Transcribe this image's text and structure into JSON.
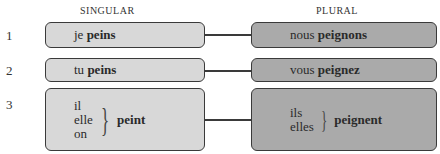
{
  "headers": {
    "singular": "SINGULAR",
    "plural": "PLURAL"
  },
  "rows": [
    {
      "number": "1",
      "singular": {
        "pronoun": "je",
        "verb": "peins"
      },
      "plural": {
        "pronoun": "nous",
        "verb": "peignons"
      }
    },
    {
      "number": "2",
      "singular": {
        "pronoun": "tu",
        "verb": "peins"
      },
      "plural": {
        "pronoun": "vous",
        "verb": "peignez"
      }
    },
    {
      "number": "3",
      "singular": {
        "pronouns": [
          "il",
          "elle",
          "on"
        ],
        "verb": "peint"
      },
      "plural": {
        "pronouns": [
          "ils",
          "elles"
        ],
        "verb": "peignent"
      }
    }
  ],
  "colors": {
    "singular_fill": "#d8d8d8",
    "plural_fill": "#aaaaaa",
    "border": "#3a3a3a"
  }
}
